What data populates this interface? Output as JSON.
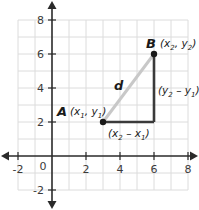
{
  "diagram": {
    "type": "distance-formula-coordinate-plane",
    "x_range": [
      -2,
      8
    ],
    "y_range": [
      -2,
      8
    ],
    "grid_step": 1,
    "x_tick_labels": [
      "-2",
      "2",
      "4",
      "6",
      "8"
    ],
    "y_tick_labels": [
      "8",
      "6",
      "4",
      "2",
      "-2"
    ],
    "origin_label": "0",
    "points": [
      {
        "name": "A",
        "x": 3,
        "y": 2,
        "coords_label": {
          "x": "x",
          "x_sub": "1",
          "y": "y",
          "y_sub": "1"
        }
      },
      {
        "name": "B",
        "x": 6,
        "y": 6,
        "coords_label": {
          "x": "x",
          "x_sub": "2",
          "y": "y",
          "y_sub": "2"
        }
      }
    ],
    "segments": {
      "hypotenuse": {
        "label": "d",
        "color": "#c8c8c8"
      },
      "horizontal_leg": {
        "label": {
          "a": "x",
          "a_sub": "2",
          "op": "–",
          "b": "x",
          "b_sub": "1"
        },
        "color": "#3a3a3a"
      },
      "vertical_leg": {
        "label": {
          "a": "y",
          "a_sub": "2",
          "op": "–",
          "b": "y",
          "b_sub": "1"
        },
        "color": "#3a3a3a"
      }
    },
    "colors": {
      "grid": "#dcdcdc",
      "axis": "#2a2a2a",
      "hypotenuse": "#c8c8c8",
      "legs": "#3a3a3a",
      "point": "#1a1a1a"
    }
  }
}
